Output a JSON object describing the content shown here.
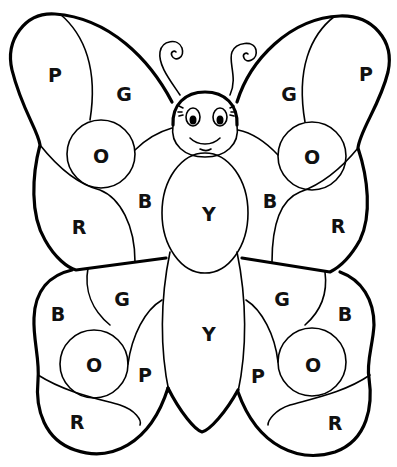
{
  "labels": {
    "upper_left": {
      "outer": "P",
      "top": "G",
      "circle": "O",
      "inner": "B",
      "lower": "R"
    },
    "upper_right": {
      "outer": "P",
      "top": "G",
      "circle": "O",
      "inner": "B",
      "lower": "R"
    },
    "lower_left": {
      "outer": "B",
      "top": "G",
      "circle": "O",
      "inner": "P",
      "lower": "R"
    },
    "lower_right": {
      "outer": "B",
      "top": "G",
      "circle": "O",
      "inner": "P",
      "lower": "R"
    },
    "body": {
      "thorax": "Y",
      "abdomen": "Y"
    }
  },
  "legend": {
    "P": "Pink",
    "G": "Green",
    "O": "Orange",
    "B": "Blue",
    "R": "Red",
    "Y": "Yellow"
  }
}
